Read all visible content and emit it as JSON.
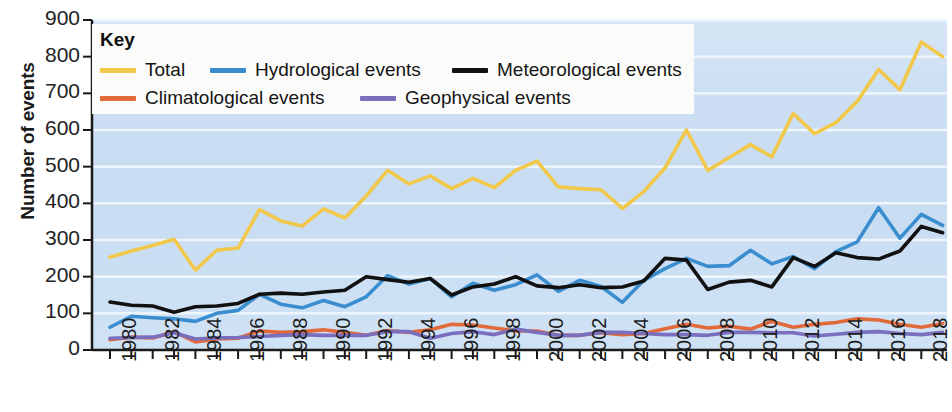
{
  "chart_data": {
    "type": "line",
    "title": "",
    "xlabel": "",
    "ylabel": "Number of events",
    "ylim": [
      0,
      900
    ],
    "xlim": [
      1980,
      2019
    ],
    "ytick_values": [
      900,
      800,
      700,
      600,
      500,
      400,
      300,
      200,
      100,
      0
    ],
    "ytick_labels": [
      "900",
      "800",
      "700",
      "600",
      "500",
      "400",
      "300",
      "200",
      "100",
      "0"
    ],
    "xtick_labels": [
      "1980",
      "1982",
      "1984",
      "1986",
      "1988",
      "1990",
      "1992",
      "1994",
      "1996",
      "1998",
      "2000",
      "2002",
      "2004",
      "2006",
      "2008",
      "2010",
      "2012",
      "2014",
      "2016",
      "2018"
    ],
    "grid": true,
    "grid_orientation": "horizontal",
    "legend_position": "top-left",
    "plot_background": "#cfe0f2",
    "x": [
      1980,
      1981,
      1982,
      1983,
      1984,
      1985,
      1986,
      1987,
      1988,
      1989,
      1990,
      1991,
      1992,
      1993,
      1994,
      1995,
      1996,
      1997,
      1998,
      1999,
      2000,
      2001,
      2002,
      2003,
      2004,
      2005,
      2006,
      2007,
      2008,
      2009,
      2010,
      2011,
      2012,
      2013,
      2014,
      2015,
      2016,
      2017,
      2018,
      2019
    ],
    "series": [
      {
        "name": "Total",
        "color": "#f2c84b",
        "values": [
          253,
          270,
          285,
          302,
          218,
          272,
          278,
          383,
          352,
          338,
          385,
          360,
          420,
          490,
          453,
          475,
          440,
          468,
          443,
          490,
          515,
          445,
          440,
          437,
          386,
          432,
          497,
          600,
          490,
          525,
          560,
          527,
          645,
          590,
          620,
          678,
          765,
          710,
          840,
          800
        ]
      },
      {
        "name": "Hydrological events",
        "color": "#3a8ed0",
        "values": [
          62,
          92,
          88,
          85,
          78,
          100,
          108,
          152,
          125,
          115,
          135,
          118,
          145,
          203,
          180,
          195,
          145,
          182,
          163,
          178,
          205,
          160,
          190,
          173,
          130,
          190,
          222,
          250,
          228,
          230,
          272,
          235,
          255,
          222,
          268,
          295,
          388,
          305,
          370,
          340
        ]
      },
      {
        "name": "Meteorological events",
        "color": "#111111",
        "values": [
          131,
          122,
          120,
          103,
          118,
          120,
          127,
          152,
          155,
          152,
          158,
          163,
          200,
          192,
          185,
          195,
          150,
          172,
          180,
          200,
          175,
          170,
          178,
          170,
          172,
          188,
          250,
          245,
          165,
          185,
          190,
          172,
          252,
          228,
          265,
          252,
          248,
          270,
          337,
          320
        ]
      },
      {
        "name": "Climatological events",
        "color": "#e2693a",
        "values": [
          28,
          35,
          33,
          50,
          22,
          30,
          32,
          52,
          48,
          50,
          55,
          48,
          40,
          53,
          48,
          55,
          70,
          68,
          60,
          52,
          52,
          40,
          40,
          47,
          42,
          45,
          58,
          70,
          60,
          65,
          57,
          78,
          62,
          70,
          75,
          85,
          82,
          70,
          62,
          72
        ]
      },
      {
        "name": "Geophysical events",
        "color": "#7a6fbe",
        "values": [
          32,
          34,
          35,
          47,
          30,
          33,
          34,
          37,
          40,
          42,
          40,
          40,
          40,
          50,
          50,
          32,
          45,
          50,
          42,
          57,
          48,
          40,
          40,
          48,
          48,
          45,
          42,
          42,
          40,
          48,
          48,
          47,
          47,
          38,
          43,
          48,
          50,
          45,
          42,
          48
        ]
      }
    ]
  },
  "legend": {
    "title": "Key",
    "entries": [
      {
        "label": "Total",
        "color": "#f2c84b"
      },
      {
        "label": "Hydrological events",
        "color": "#3a8ed0"
      },
      {
        "label": "Meteorological events",
        "color": "#111111"
      },
      {
        "label": "Climatological events",
        "color": "#e2693a"
      },
      {
        "label": "Geophysical events",
        "color": "#7a6fbe"
      }
    ]
  },
  "axes": {
    "y_title": "Number of events"
  }
}
